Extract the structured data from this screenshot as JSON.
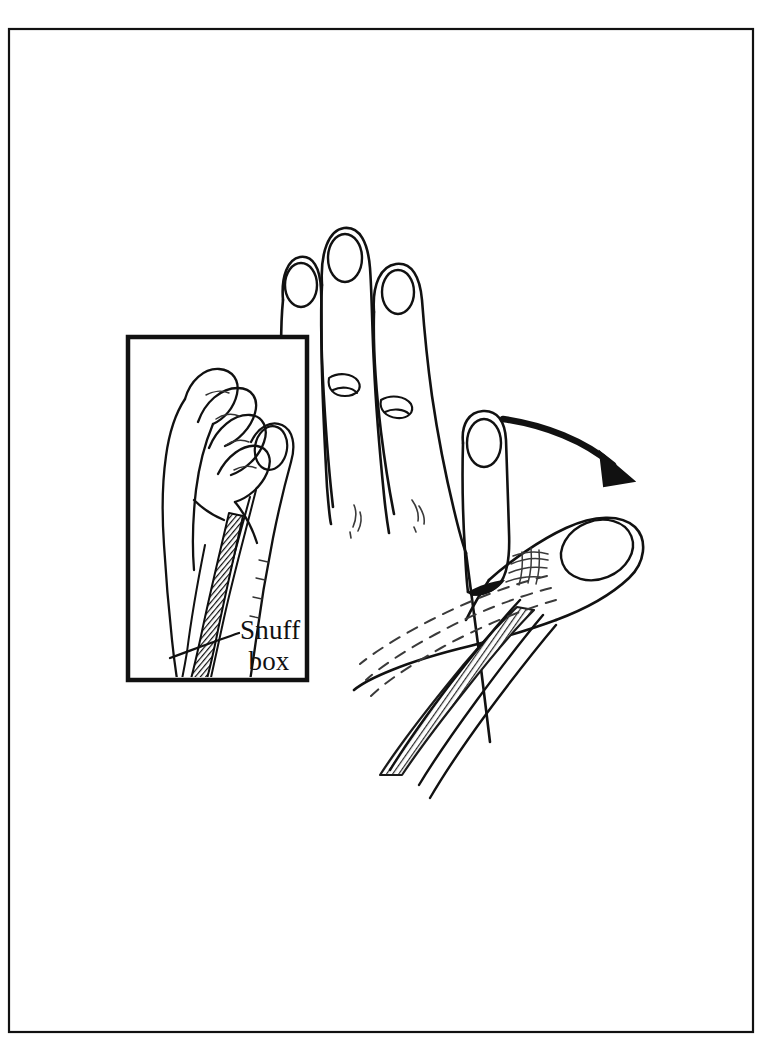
{
  "page": {
    "background_color": "#ffffff",
    "ink_color": "#111111",
    "border": {
      "name": "page-border",
      "x": 9,
      "y": 29,
      "width": 744,
      "height": 1003,
      "stroke_width": 2.2
    }
  },
  "figure": {
    "style": "black-and-white stipple line art"
  },
  "inset": {
    "name": "inset-panel",
    "x": 128,
    "y": 337,
    "width": 179,
    "height": 343,
    "stroke_width": 4.5,
    "view": "radial view of hand with curled fingers and extended thumb",
    "label": {
      "line1": "Snuff",
      "line2": "box",
      "x": 240,
      "y": 636,
      "font_size": 27
    },
    "leader_line": {
      "name": "snuffbox-leader-line",
      "from_x": 238,
      "from_y": 634,
      "to_x": 169,
      "to_y": 656
    }
  },
  "main_figure": {
    "name": "main-hand-illustration",
    "fingers": [
      "ring",
      "middle",
      "index"
    ],
    "thumb_positions": [
      "adducted",
      "abducted"
    ],
    "highlight": {
      "name": "snuffbox-highlight-band",
      "fill": "hatched-gray",
      "description": "hatched band marking the anatomical snuff box between tendons"
    },
    "dashed_lines": {
      "name": "hidden-tendon-dashed-lines",
      "count": 3,
      "description": "dashed lines indicating underlying tendons"
    }
  },
  "arrow": {
    "name": "thumb-abduction-arrow",
    "start_x": 502,
    "start_y": 418,
    "end_x": 625,
    "end_y": 471,
    "stroke_width": 6,
    "direction": "curved right and downward"
  },
  "colors": {
    "ink": "#111111",
    "paper": "#ffffff",
    "hatch_gray": "#7a7a7a"
  }
}
